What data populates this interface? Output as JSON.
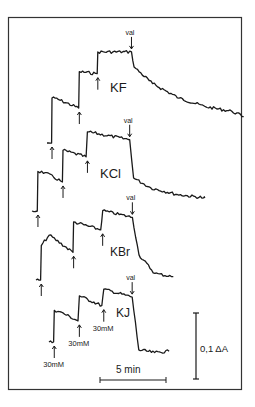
{
  "chart_data": {
    "type": "line",
    "title": "",
    "xlabel": "",
    "ylabel": "",
    "grid": false,
    "scale_bars": {
      "time": "5 min",
      "absorbance": "0,1 ΔA"
    },
    "annotations": {
      "washout": "val",
      "addition": "30mM"
    },
    "series": [
      {
        "name": "KF",
        "units_note": "time in min, signal in ΔA relative to baseline",
        "points": [
          [
            0,
            0
          ],
          [
            0.35,
            0
          ],
          [
            0.38,
            0.068
          ],
          [
            0.6,
            0.068
          ],
          [
            2.4,
            0.053
          ],
          [
            2.45,
            0.108
          ],
          [
            3.8,
            0.105
          ],
          [
            3.85,
            0.138
          ],
          [
            6.4,
            0.138
          ],
          [
            6.6,
            0.115
          ],
          [
            8,
            0.09
          ],
          [
            10,
            0.068
          ],
          [
            12,
            0.055
          ],
          [
            14,
            0.048
          ],
          [
            14.9,
            0.04
          ]
        ],
        "additions_at_min": [
          0.38,
          2.45,
          3.85
        ],
        "washout_at_min": 6.4
      },
      {
        "name": "KCl",
        "points": [
          [
            0,
            0
          ],
          [
            0.4,
            0
          ],
          [
            0.45,
            0.06
          ],
          [
            1,
            0.058
          ],
          [
            2.3,
            0.044
          ],
          [
            2.35,
            0.092
          ],
          [
            4.1,
            0.082
          ],
          [
            4.2,
            0.12
          ],
          [
            7.4,
            0.108
          ],
          [
            7.7,
            0.05
          ],
          [
            9,
            0.035
          ],
          [
            11,
            0.025
          ],
          [
            13,
            0.02
          ],
          [
            13.1,
            0.02
          ]
        ],
        "additions_at_min": [
          0.45,
          2.35,
          4.2
        ],
        "washout_at_min": 7.4
      },
      {
        "name": "KBr",
        "points": [
          [
            0,
            0
          ],
          [
            0.35,
            0
          ],
          [
            0.4,
            0.052
          ],
          [
            1,
            0.068
          ],
          [
            2.8,
            0.042
          ],
          [
            2.85,
            0.088
          ],
          [
            4.9,
            0.076
          ],
          [
            5.05,
            0.105
          ],
          [
            7.3,
            0.095
          ],
          [
            7.8,
            0.038
          ],
          [
            9,
            0.01
          ],
          [
            10.4,
            0.005
          ]
        ],
        "additions_at_min": [
          0.4,
          2.85,
          5.05
        ],
        "washout_at_min": 7.3
      },
      {
        "name": "KJ",
        "points": [
          [
            0,
            0
          ],
          [
            0.35,
            0
          ],
          [
            0.4,
            0.048
          ],
          [
            0.8,
            0.046
          ],
          [
            2.2,
            0.032
          ],
          [
            2.3,
            0.07
          ],
          [
            4,
            0.055
          ],
          [
            4.15,
            0.08
          ],
          [
            6.3,
            0.068
          ],
          [
            6.8,
            -0.012
          ],
          [
            8,
            -0.016
          ],
          [
            9.1,
            -0.014
          ]
        ],
        "additions_at_min": [
          0.4,
          2.3,
          4.15
        ],
        "washout_at_min": 6.3
      }
    ]
  }
}
